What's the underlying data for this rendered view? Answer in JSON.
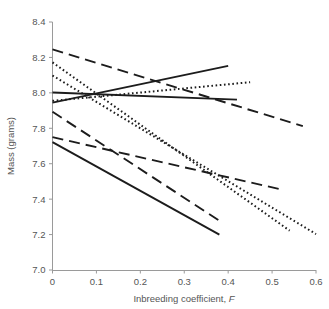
{
  "chart_data": {
    "type": "line",
    "title": "",
    "subtitle": "",
    "xlabel": "Inbreeding coefficient, F",
    "xlabel_plain": "Inbreeding coefficient,",
    "xlabel_italic": "F",
    "ylabel": "Mass (grams)",
    "xlim": [
      0,
      0.6
    ],
    "ylim": [
      7.0,
      8.4
    ],
    "xticks": [
      0,
      0.1,
      0.2,
      0.3,
      0.4,
      0.5,
      0.6
    ],
    "xticklabels": [
      "0",
      "0.1",
      "0.2",
      "0.3",
      "0.4",
      "0.5",
      "0.6"
    ],
    "yticks": [
      7.0,
      7.2,
      7.4,
      7.6,
      7.8,
      8.0,
      8.2,
      8.4
    ],
    "yticklabels": [
      "7.0",
      "7.2",
      "7.4",
      "7.6",
      "7.8",
      "8.0",
      "8.2",
      "8.4"
    ],
    "grid": false,
    "legend": false,
    "legend_position": "none",
    "line_color": "#1c1c1c",
    "axis_color": "#9a9a9a",
    "series": [
      {
        "name": "solid-rising",
        "style": "solid",
        "dasharray": "",
        "width": 1.9,
        "x": [
          0.0,
          0.4
        ],
        "y": [
          7.945,
          8.152
        ],
        "values": [
          7.945,
          8.152
        ]
      },
      {
        "name": "solid-flat",
        "style": "solid",
        "dasharray": "",
        "width": 1.9,
        "x": [
          0.0,
          0.42
        ],
        "y": [
          8.002,
          7.962
        ],
        "values": [
          8.002,
          7.962
        ]
      },
      {
        "name": "solid-steep-falling",
        "style": "solid",
        "dasharray": "",
        "width": 1.9,
        "x": [
          0.0,
          0.38
        ],
        "y": [
          7.722,
          7.2
        ],
        "values": [
          7.722,
          7.2
        ]
      },
      {
        "name": "dashed-long-upper",
        "style": "dashed",
        "dasharray": "11,6",
        "width": 1.9,
        "x": [
          0.0,
          0.57
        ],
        "y": [
          8.245,
          7.812
        ],
        "values": [
          8.245,
          7.812
        ]
      },
      {
        "name": "dashed-mid-falling",
        "style": "dashed",
        "dasharray": "11,6",
        "width": 1.9,
        "x": [
          0.0,
          0.38
        ],
        "y": [
          7.893,
          7.278
        ],
        "values": [
          7.893,
          7.278
        ]
      },
      {
        "name": "dashed-lower-shallow",
        "style": "dashed",
        "dasharray": "11,6",
        "width": 1.9,
        "x": [
          0.0,
          0.52
        ],
        "y": [
          7.75,
          7.455
        ],
        "values": [
          7.75,
          7.455
        ]
      },
      {
        "name": "dotted-rising",
        "style": "dotted",
        "dasharray": "1.6,2.6",
        "width": 2.0,
        "x": [
          0.0,
          0.45
        ],
        "y": [
          7.955,
          8.06
        ],
        "values": [
          7.955,
          8.06
        ]
      },
      {
        "name": "dotted-steep-falling-a",
        "style": "dotted",
        "dasharray": "1.6,2.6",
        "width": 2.0,
        "x": [
          0.0,
          0.54
        ],
        "y": [
          8.172,
          7.222
        ],
        "values": [
          8.172,
          7.222
        ]
      },
      {
        "name": "dotted-steep-falling-b",
        "style": "dotted",
        "dasharray": "1.6,2.6",
        "width": 2.0,
        "x": [
          0.0,
          0.6
        ],
        "y": [
          8.098,
          7.203
        ],
        "values": [
          8.098,
          7.203
        ]
      }
    ]
  },
  "axis": {
    "x_title_plain": "Inbreeding coefficient,",
    "x_title_italic": "F",
    "y_title": "Mass (grams)"
  }
}
